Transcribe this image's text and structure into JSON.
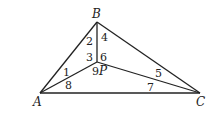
{
  "diagram": {
    "type": "triangle-with-interior-point",
    "vertices": {
      "A": {
        "label": "A",
        "x": 40,
        "y": 93
      },
      "B": {
        "label": "B",
        "x": 97,
        "y": 22
      },
      "C": {
        "label": "C",
        "x": 200,
        "y": 93
      },
      "P": {
        "label": "P",
        "x": 97,
        "y": 62
      }
    },
    "segments": [
      [
        "A",
        "B"
      ],
      [
        "B",
        "C"
      ],
      [
        "A",
        "C"
      ],
      [
        "B",
        "P"
      ],
      [
        "A",
        "P"
      ],
      [
        "C",
        "P"
      ]
    ],
    "angle_labels": [
      {
        "text": "1",
        "x": 63,
        "y": 76
      },
      {
        "text": "2",
        "x": 86,
        "y": 45
      },
      {
        "text": "3",
        "x": 86,
        "y": 61
      },
      {
        "text": "4",
        "x": 101,
        "y": 41
      },
      {
        "text": "5",
        "x": 155,
        "y": 77
      },
      {
        "text": "6",
        "x": 100,
        "y": 61
      },
      {
        "text": "7",
        "x": 147,
        "y": 91
      },
      {
        "text": "8",
        "x": 65,
        "y": 89
      },
      {
        "text": "9",
        "x": 92,
        "y": 75
      }
    ]
  }
}
